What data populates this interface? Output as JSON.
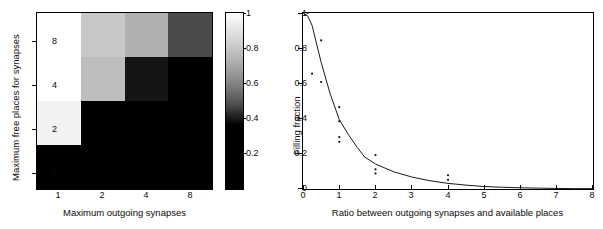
{
  "chart_data": [
    {
      "type": "heatmap",
      "title": "",
      "xlabel": "Maximum outgoing synapses",
      "ylabel": "Maximum free places for synapses",
      "xticklabels": [
        "1",
        "2",
        "4",
        "8"
      ],
      "yticklabels": [
        "8",
        "4",
        "2",
        "1"
      ],
      "x_categories": [
        1,
        2,
        4,
        8
      ],
      "y_categories": [
        8,
        4,
        2,
        1
      ],
      "colorbar": {
        "label": "",
        "ticklabels": [
          "1",
          "0.8",
          "0.6",
          "0.4",
          "0.2"
        ],
        "tickvalues": [
          1,
          0.8,
          0.6,
          0.4,
          0.2
        ],
        "vmin": 0,
        "vmax": 1,
        "cmap": "gray"
      },
      "rows": [
        {
          "y": 8,
          "values": [
            1.0,
            0.78,
            0.68,
            0.28
          ]
        },
        {
          "y": 4,
          "values": [
            1.0,
            0.72,
            0.08,
            0.0
          ]
        },
        {
          "y": 2,
          "values": [
            0.93,
            0.0,
            0.0,
            0.0
          ]
        },
        {
          "y": 1,
          "values": [
            0.0,
            0.0,
            0.0,
            0.0
          ]
        }
      ],
      "cell_colors": [
        [
          "#ffffff",
          "#c8c8c8",
          "#b0b0b0",
          "#4a4a4a"
        ],
        [
          "#ffffff",
          "#bdbdbd",
          "#151515",
          "#000000"
        ],
        [
          "#f2f2f2",
          "#000000",
          "#000000",
          "#000000"
        ],
        [
          "#000000",
          "#000000",
          "#000000",
          "#000000"
        ]
      ]
    },
    {
      "type": "scatter",
      "title": "",
      "xlabel": "Ratio between outgoing synapses and available places",
      "ylabel": "Filling fraction",
      "xlim": [
        0,
        8
      ],
      "ylim": [
        0,
        1
      ],
      "xticklabels": [
        "0",
        "1",
        "2",
        "3",
        "4",
        "5",
        "6",
        "7",
        "8"
      ],
      "yticklabels": [
        "0",
        "0.2",
        "0.4",
        "0.6",
        "0.8",
        "1"
      ],
      "grid": false,
      "legend": "none",
      "series": [
        {
          "name": "data points",
          "marker": "dot",
          "points": [
            [
              0.125,
              1.0
            ],
            [
              0.25,
              0.655
            ],
            [
              0.5,
              0.845
            ],
            [
              0.5,
              0.608
            ],
            [
              1.0,
              0.465
            ],
            [
              1.0,
              0.385
            ],
            [
              1.0,
              0.295
            ],
            [
              1.0,
              0.268
            ],
            [
              2.0,
              0.193
            ],
            [
              2.0,
              0.112
            ],
            [
              2.0,
              0.088
            ],
            [
              4.0,
              0.078
            ],
            [
              4.0,
              0.052
            ]
          ]
        },
        {
          "name": "fitted curve",
          "marker": "line",
          "points": [
            [
              0.0,
              1.0
            ],
            [
              0.125,
              0.985
            ],
            [
              0.25,
              0.93
            ],
            [
              0.5,
              0.72
            ],
            [
              0.75,
              0.54
            ],
            [
              1.0,
              0.395
            ],
            [
              1.25,
              0.31
            ],
            [
              1.5,
              0.235
            ],
            [
              1.7,
              0.182
            ],
            [
              2.0,
              0.142
            ],
            [
              2.5,
              0.098
            ],
            [
              3.0,
              0.068
            ],
            [
              3.5,
              0.047
            ],
            [
              4.0,
              0.032
            ],
            [
              4.5,
              0.022
            ],
            [
              5.0,
              0.014
            ],
            [
              5.5,
              0.01
            ],
            [
              6.0,
              0.007
            ],
            [
              6.5,
              0.005
            ],
            [
              7.0,
              0.003
            ],
            [
              7.5,
              0.002
            ],
            [
              8.0,
              0.002
            ]
          ]
        }
      ]
    }
  ],
  "heatmap_panel": {
    "xlabel": "Maximum outgoing synapses",
    "ylabel": "Maximum free places for synapses",
    "xticks": [
      "1",
      "2",
      "4",
      "8"
    ],
    "yticks": [
      "8",
      "4",
      "2",
      "1"
    ],
    "colorbar_ticks": [
      "1",
      "0.8",
      "0.6",
      "0.4",
      "0.2"
    ]
  },
  "curve_panel": {
    "xlabel": "Ratio between outgoing synapses and available places",
    "ylabel": "Filling fraction",
    "xticks": [
      "0",
      "1",
      "2",
      "3",
      "4",
      "5",
      "6",
      "7",
      "8"
    ],
    "yticks": [
      "0",
      "0.2",
      "0.4",
      "0.6",
      "0.8",
      "1"
    ]
  }
}
